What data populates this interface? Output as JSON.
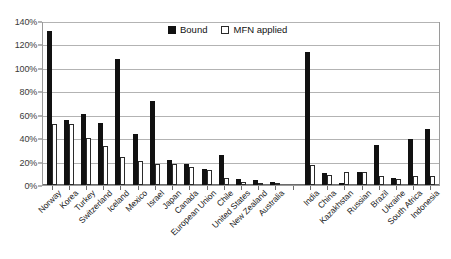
{
  "chart_data": {
    "type": "bar",
    "title": "",
    "xlabel": "",
    "ylabel": "",
    "ylim": [
      0,
      140
    ],
    "ytick_values": [
      0,
      20,
      40,
      60,
      80,
      100,
      120,
      140
    ],
    "ytick_labels": [
      "0%",
      "20%",
      "40%",
      "60%",
      "80%",
      "100%",
      "120%",
      "140%"
    ],
    "grid": true,
    "legend_position": "top-center",
    "categories": [
      "Norway",
      "Korea",
      "Turkey",
      "Switzerland",
      "Iceland",
      "Mexico",
      "Israel",
      "Japan",
      "Canada",
      "European Union",
      "Chile",
      "United States",
      "New Zealand",
      "Australia",
      "",
      "India",
      "China",
      "Kazakhstan",
      "Russian",
      "Brazil",
      "Ukraine",
      "South Africa",
      "Indonesia"
    ],
    "series": [
      {
        "name": "Bound",
        "color": "#111111",
        "values": [
          133,
          56,
          61,
          54,
          109,
          44,
          73,
          22,
          18,
          14,
          26,
          5,
          4,
          3,
          null,
          115,
          10,
          0,
          11,
          35,
          6,
          40,
          48
        ]
      },
      {
        "name": "MFN applied",
        "color": "#ffffff",
        "values": [
          53,
          53,
          41,
          34,
          24,
          21,
          18,
          18,
          16,
          13,
          6,
          3,
          2,
          1,
          null,
          17,
          9,
          11,
          11,
          8,
          5,
          8,
          8
        ]
      }
    ]
  },
  "legend": {
    "items": [
      {
        "label": "Bound",
        "swatch": "filled-square-icon"
      },
      {
        "label": "MFN applied",
        "swatch": "outlined-square-icon"
      }
    ]
  }
}
